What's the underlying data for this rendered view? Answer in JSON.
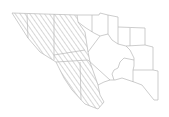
{
  "map": {
    "title": "County map with hatched region",
    "colors": {
      "background": "#ffffff",
      "border": "#b8b8b8",
      "hatch": "#9a9a9a"
    },
    "legend": [],
    "regions": [
      {
        "id": "hatched-north",
        "hatched": true
      },
      {
        "id": "hatched-middle",
        "hatched": true
      },
      {
        "id": "hatched-south-west",
        "hatched": true
      },
      {
        "id": "hatched-south-east",
        "hatched": true
      }
    ]
  }
}
